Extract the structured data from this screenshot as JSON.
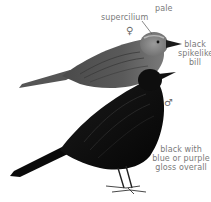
{
  "figure": {
    "labels": {
      "supercilium": [
        "pale",
        "supercilium"
      ],
      "bill": [
        "black",
        "spikelike",
        "bill"
      ],
      "gloss": [
        "black with",
        "blue or purple",
        "gloss overall"
      ]
    },
    "symbols": {
      "female": "♀",
      "male": "♂"
    },
    "colors": {
      "background": "#ffffff",
      "female_plumage": "#5e5e5e",
      "female_head": "#8a8a8a",
      "male_plumage": "#0d0d0d",
      "label_text": "#7a7a7a"
    }
  }
}
